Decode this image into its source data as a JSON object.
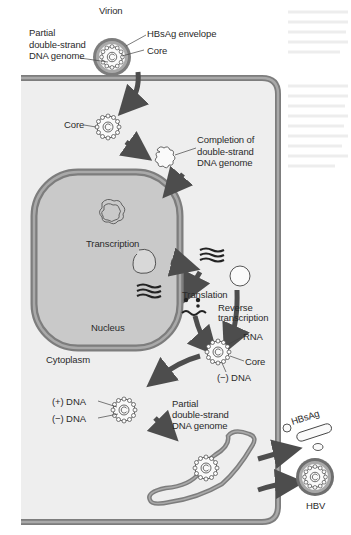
{
  "figure": {
    "colors": {
      "background": "#ffffff",
      "cell_fill": "#eeeeee",
      "membrane": "#7d7d7d",
      "membrane_light": "#a9a9a9",
      "nucleus_fill": "#c9c9c9",
      "arrow": "#4d4d4d",
      "text": "#2a2a2a"
    },
    "labels": {
      "virion": "Virion",
      "hbsag_envelope": "HBsAg envelope",
      "core_top": "Core",
      "partial_genome_top": "Partial\ndouble-strand\nDNA genome",
      "core_cytoplasm": "Core",
      "completion": "Completion of\ndouble-strand\nDNA genome",
      "transcription": "Transcription",
      "nucleus": "Nucleus",
      "translation": "Translation",
      "reverse_transcription": "Reverse\ntranscription",
      "rna": "RNA",
      "core_rt": "Core",
      "minus_dna_rt": "(−) DNA",
      "cytoplasm": "Cytoplasm",
      "plus_dna": "(+) DNA",
      "minus_dna": "(−) DNA",
      "partial_genome_bottom": "Partial\ndouble-strand\nDNA genome",
      "hbsag": "HBsAg",
      "hbv": "HBV"
    },
    "steps": [
      "Virion attaches and enters hepatocyte",
      "Core released into cytoplasm",
      "Completion of double-strand DNA genome",
      "Transcription in nucleus",
      "Translation",
      "Reverse transcription in core",
      "Partial double-strand DNA genome",
      "Budding through membrane",
      "Release of HBsAg particles and HBV"
    ]
  }
}
